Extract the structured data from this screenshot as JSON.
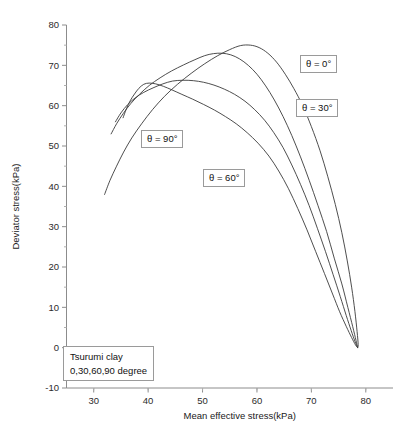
{
  "chart_data": {
    "type": "line",
    "title": "",
    "xlabel": "Mean effective stress(kPa)",
    "ylabel": "Deviator stress(kPa)",
    "xlim": [
      25,
      85
    ],
    "ylim": [
      -10,
      80
    ],
    "xticks": [
      30,
      40,
      50,
      60,
      70,
      80
    ],
    "yticks": [
      -10,
      0,
      10,
      20,
      30,
      40,
      50,
      60,
      70,
      80
    ],
    "xtick_labels": [
      "30",
      "40",
      "50",
      "60",
      "70",
      "80"
    ],
    "ytick_labels": [
      "-10",
      "0",
      "10",
      "20",
      "30",
      "40",
      "50",
      "60",
      "70",
      "80"
    ],
    "grid": false,
    "legend_position": "inline-annotations",
    "annotations": [
      {
        "name": "theta-0",
        "text": "θ = 0°",
        "x": 300,
        "y": 55
      },
      {
        "name": "theta-30",
        "text": "θ = 30°",
        "x": 296,
        "y": 99
      },
      {
        "name": "theta-90",
        "text": "θ = 90°",
        "x": 141,
        "y": 130
      },
      {
        "name": "theta-60",
        "text": "θ = 60°",
        "x": 203,
        "y": 169
      },
      {
        "name": "sample-info",
        "line1": "Tsurumi clay",
        "line2": "0,30,60,90 degree",
        "x": 63,
        "y": 346
      }
    ],
    "series": [
      {
        "name": "θ = 0°",
        "label": "theta-0",
        "peak": {
          "x": 57.0,
          "y": 75.0
        },
        "points": [
          [
            32.0,
            38.0
          ],
          [
            33.0,
            41.5
          ],
          [
            34.2,
            45.0
          ],
          [
            35.5,
            48.5
          ],
          [
            37.0,
            52.0
          ],
          [
            38.8,
            55.5
          ],
          [
            40.8,
            59.0
          ],
          [
            43.0,
            62.3
          ],
          [
            45.4,
            65.3
          ],
          [
            47.9,
            68.0
          ],
          [
            50.4,
            70.4
          ],
          [
            52.8,
            72.4
          ],
          [
            55.0,
            73.9
          ],
          [
            57.0,
            74.9
          ],
          [
            58.8,
            75.0
          ],
          [
            60.4,
            74.4
          ],
          [
            62.0,
            73.0
          ],
          [
            63.6,
            70.8
          ],
          [
            65.2,
            67.8
          ],
          [
            66.8,
            64.2
          ],
          [
            68.4,
            60.0
          ],
          [
            70.0,
            54.8
          ],
          [
            71.6,
            48.8
          ],
          [
            73.0,
            42.5
          ],
          [
            74.4,
            35.5
          ],
          [
            75.6,
            28.5
          ],
          [
            76.6,
            21.5
          ],
          [
            77.4,
            15.0
          ],
          [
            78.0,
            9.0
          ],
          [
            78.4,
            4.0
          ],
          [
            78.6,
            0.8
          ],
          [
            78.5,
            0.0
          ]
        ]
      },
      {
        "name": "θ = 30°",
        "label": "theta-30",
        "peak": {
          "x": 52.0,
          "y": 73.0
        },
        "points": [
          [
            33.2,
            53.0
          ],
          [
            34.2,
            55.5
          ],
          [
            35.4,
            58.0
          ],
          [
            36.8,
            60.5
          ],
          [
            38.4,
            62.8
          ],
          [
            40.2,
            65.0
          ],
          [
            42.2,
            66.9
          ],
          [
            44.3,
            68.6
          ],
          [
            46.5,
            70.1
          ],
          [
            48.6,
            71.4
          ],
          [
            50.4,
            72.4
          ],
          [
            52.0,
            72.9
          ],
          [
            53.6,
            73.0
          ],
          [
            55.2,
            72.6
          ],
          [
            56.8,
            71.6
          ],
          [
            58.4,
            70.0
          ],
          [
            60.0,
            67.8
          ],
          [
            61.6,
            64.9
          ],
          [
            63.2,
            61.4
          ],
          [
            64.8,
            57.3
          ],
          [
            66.4,
            52.6
          ],
          [
            68.0,
            47.3
          ],
          [
            69.6,
            41.5
          ],
          [
            71.2,
            35.3
          ],
          [
            72.8,
            28.8
          ],
          [
            74.2,
            22.2
          ],
          [
            75.6,
            15.8
          ],
          [
            76.7,
            10.0
          ],
          [
            77.6,
            5.2
          ],
          [
            78.2,
            1.8
          ],
          [
            78.5,
            0.0
          ]
        ]
      },
      {
        "name": "θ = 60°",
        "label": "theta-60",
        "peak": {
          "x": 44.5,
          "y": 66.3
        },
        "points": [
          [
            34.0,
            56.0
          ],
          [
            35.0,
            58.2
          ],
          [
            36.2,
            60.2
          ],
          [
            37.6,
            61.9
          ],
          [
            39.2,
            63.3
          ],
          [
            40.9,
            64.4
          ],
          [
            42.7,
            65.4
          ],
          [
            44.5,
            66.1
          ],
          [
            46.4,
            66.3
          ],
          [
            48.3,
            66.2
          ],
          [
            50.2,
            65.8
          ],
          [
            52.1,
            65.1
          ],
          [
            54.0,
            64.1
          ],
          [
            55.9,
            62.8
          ],
          [
            57.8,
            61.1
          ],
          [
            59.6,
            59.0
          ],
          [
            61.4,
            56.4
          ],
          [
            63.1,
            53.3
          ],
          [
            64.8,
            49.6
          ],
          [
            66.4,
            45.3
          ],
          [
            68.0,
            40.5
          ],
          [
            69.6,
            35.2
          ],
          [
            71.1,
            29.6
          ],
          [
            72.6,
            23.8
          ],
          [
            74.0,
            18.1
          ],
          [
            75.3,
            12.7
          ],
          [
            76.4,
            8.0
          ],
          [
            77.3,
            4.3
          ],
          [
            78.0,
            1.6
          ],
          [
            78.5,
            0.0
          ]
        ]
      },
      {
        "name": "θ = 90°",
        "label": "theta-90",
        "peak": {
          "x": 39.0,
          "y": 65.6
        },
        "points": [
          [
            35.4,
            57.0
          ],
          [
            36.0,
            59.2
          ],
          [
            36.7,
            61.2
          ],
          [
            37.5,
            62.9
          ],
          [
            38.3,
            64.3
          ],
          [
            39.2,
            65.3
          ],
          [
            40.2,
            65.6
          ],
          [
            41.4,
            65.4
          ],
          [
            42.8,
            64.8
          ],
          [
            44.4,
            63.9
          ],
          [
            46.2,
            62.8
          ],
          [
            48.2,
            61.6
          ],
          [
            50.2,
            60.3
          ],
          [
            52.2,
            58.9
          ],
          [
            54.2,
            57.3
          ],
          [
            56.2,
            55.5
          ],
          [
            58.2,
            53.3
          ],
          [
            60.2,
            50.7
          ],
          [
            62.2,
            47.5
          ],
          [
            64.0,
            43.8
          ],
          [
            65.8,
            39.4
          ],
          [
            67.5,
            34.5
          ],
          [
            69.2,
            29.2
          ],
          [
            70.8,
            23.8
          ],
          [
            72.4,
            18.4
          ],
          [
            73.9,
            13.3
          ],
          [
            75.2,
            8.9
          ],
          [
            76.4,
            5.3
          ],
          [
            77.4,
            2.5
          ],
          [
            78.1,
            0.7
          ],
          [
            78.5,
            0.0
          ]
        ]
      }
    ]
  }
}
